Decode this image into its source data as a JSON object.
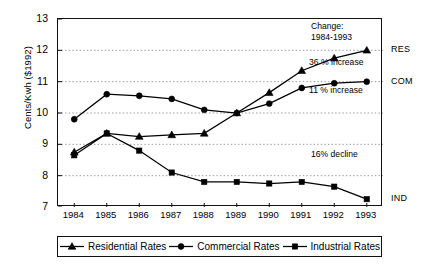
{
  "chart_data": {
    "type": "line",
    "title": "",
    "xlabel": "",
    "ylabel": "Cents/Kwh ($1992)",
    "categories": [
      "1984",
      "1985",
      "1986",
      "1987",
      "1988",
      "1989",
      "1990",
      "1991",
      "1992",
      "1993"
    ],
    "x": [
      1984,
      1985,
      1986,
      1987,
      1988,
      1989,
      1990,
      1991,
      1992,
      1993
    ],
    "ylim": [
      7,
      13
    ],
    "yticks": [
      7,
      8,
      9,
      10,
      11,
      12,
      13
    ],
    "grid": true,
    "legend_position": "bottom",
    "series": [
      {
        "name": "Residential Rates",
        "key": "RES",
        "marker": "triangle",
        "values": [
          8.75,
          9.35,
          9.25,
          9.3,
          9.35,
          10.0,
          10.65,
          11.35,
          11.75,
          12.0
        ]
      },
      {
        "name": "Commercial Rates",
        "key": "COM",
        "marker": "circle",
        "values": [
          9.8,
          10.6,
          10.55,
          10.45,
          10.1,
          10.0,
          10.3,
          10.8,
          10.95,
          11.0
        ]
      },
      {
        "name": "Industrial Rates",
        "key": "IND",
        "marker": "square",
        "values": [
          8.65,
          9.35,
          8.8,
          8.1,
          7.8,
          7.8,
          7.75,
          7.8,
          7.65,
          7.25
        ]
      }
    ],
    "annotations": [
      {
        "id": "change-title",
        "line1": "Change:",
        "line2": "1984-1993"
      },
      {
        "id": "res-change",
        "text": "36 % increase"
      },
      {
        "id": "com-change",
        "text": "11 % increase"
      },
      {
        "id": "ind-change",
        "text": "16% decline"
      }
    ],
    "right_labels": [
      {
        "key": "RES",
        "label": "RES",
        "value": 12.0
      },
      {
        "key": "COM",
        "label": "COM",
        "value": 11.0
      },
      {
        "key": "IND",
        "label": "IND",
        "value": 7.25
      }
    ],
    "colors": {
      "series": "#000000",
      "axis": "#111111",
      "grid": "#9a9a9a",
      "background": "#ffffff"
    }
  },
  "legend": {
    "items": [
      {
        "label": "Residential Rates",
        "marker": "triangle"
      },
      {
        "label": "Commercial Rates",
        "marker": "circle"
      },
      {
        "label": "Industrial Rates",
        "marker": "square"
      }
    ]
  }
}
